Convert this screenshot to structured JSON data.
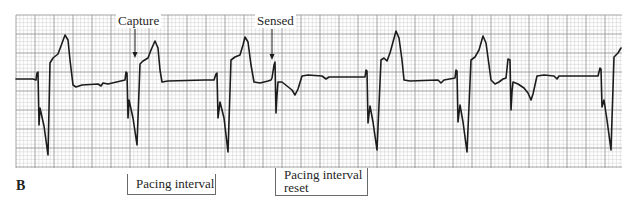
{
  "figure": {
    "panel_letter": "B",
    "colors": {
      "background": "#ffffff",
      "grid_minor": "#cfcfcf",
      "grid_major": "#8e8e8e",
      "trace": "#1c1c1c",
      "bracket": "#6a6a6a"
    },
    "grid": {
      "x0": 16,
      "y0": 15,
      "x1": 622,
      "y1": 168,
      "minor_step": 3.8,
      "major_every": 5
    },
    "annotations": [
      {
        "id": "capture",
        "label": "Capture",
        "label_x": 116,
        "label_y": 14,
        "arrow_x": 135,
        "arrow_y1": 29,
        "arrow_y2": 58
      },
      {
        "id": "sensed",
        "label": "Sensed",
        "label_x": 255,
        "label_y": 14,
        "arrow_x": 272,
        "arrow_y1": 29,
        "arrow_y2": 60
      }
    ],
    "brackets": [
      {
        "id": "pacing-interval",
        "lines": [
          "Pacing interval"
        ],
        "x": 127,
        "y": 174,
        "w": 89,
        "h": 21
      },
      {
        "id": "pacing-interval-reset",
        "lines": [
          "Pacing interval",
          "reset"
        ],
        "x": 275,
        "y": 168,
        "w": 93,
        "h": 28
      }
    ]
  },
  "chart_data": {
    "type": "line",
    "title": "",
    "panel": "B",
    "annotations": [
      "Capture",
      "Sensed"
    ],
    "interval_labels": [
      "Pacing interval",
      "Pacing interval reset"
    ],
    "paced_beats_x": [
      38,
      127,
      217,
      367,
      457,
      601
    ],
    "sensed_events_x": [
      275,
      510
    ],
    "trace_points": [
      [
        16,
        79
      ],
      [
        33,
        79
      ],
      [
        36,
        80
      ],
      [
        37,
        73
      ],
      [
        38,
        72
      ],
      [
        39,
        125
      ],
      [
        40,
        108
      ],
      [
        44,
        126
      ],
      [
        48,
        155
      ],
      [
        50,
        63
      ],
      [
        53,
        58
      ],
      [
        58,
        54
      ],
      [
        61,
        46
      ],
      [
        65,
        35
      ],
      [
        68,
        40
      ],
      [
        70,
        60
      ],
      [
        73,
        85
      ],
      [
        76,
        87
      ],
      [
        82,
        85
      ],
      [
        98,
        84
      ],
      [
        101,
        86
      ],
      [
        103,
        83
      ],
      [
        108,
        84
      ],
      [
        125,
        80
      ],
      [
        126,
        72
      ],
      [
        127,
        73
      ],
      [
        128,
        118
      ],
      [
        129,
        100
      ],
      [
        133,
        118
      ],
      [
        137,
        145
      ],
      [
        140,
        64
      ],
      [
        143,
        61
      ],
      [
        148,
        58
      ],
      [
        151,
        50
      ],
      [
        155,
        41
      ],
      [
        158,
        48
      ],
      [
        160,
        70
      ],
      [
        162,
        82
      ],
      [
        168,
        81
      ],
      [
        205,
        80
      ],
      [
        214,
        80
      ],
      [
        216,
        74
      ],
      [
        217,
        73
      ],
      [
        218,
        118
      ],
      [
        220,
        102
      ],
      [
        224,
        118
      ],
      [
        228,
        152
      ],
      [
        231,
        60
      ],
      [
        235,
        57
      ],
      [
        240,
        55
      ],
      [
        243,
        45
      ],
      [
        245,
        37
      ],
      [
        248,
        42
      ],
      [
        251,
        65
      ],
      [
        254,
        82
      ],
      [
        260,
        83
      ],
      [
        268,
        81
      ],
      [
        271,
        80
      ],
      [
        272,
        78
      ],
      [
        274,
        65
      ],
      [
        275,
        62
      ],
      [
        276,
        113
      ],
      [
        277,
        95
      ],
      [
        278,
        82
      ],
      [
        282,
        82
      ],
      [
        287,
        86
      ],
      [
        292,
        90
      ],
      [
        295,
        95
      ],
      [
        298,
        89
      ],
      [
        302,
        76
      ],
      [
        308,
        75
      ],
      [
        322,
        76
      ],
      [
        326,
        79
      ],
      [
        329,
        77
      ],
      [
        340,
        77
      ],
      [
        365,
        77
      ],
      [
        366,
        70
      ],
      [
        367,
        71
      ],
      [
        368,
        123
      ],
      [
        370,
        106
      ],
      [
        373,
        122
      ],
      [
        377,
        150
      ],
      [
        381,
        60
      ],
      [
        384,
        58
      ],
      [
        387,
        61
      ],
      [
        390,
        53
      ],
      [
        393,
        42
      ],
      [
        396,
        31
      ],
      [
        399,
        38
      ],
      [
        402,
        60
      ],
      [
        404,
        80
      ],
      [
        410,
        81
      ],
      [
        438,
        80
      ],
      [
        441,
        83
      ],
      [
        444,
        80
      ],
      [
        455,
        78
      ],
      [
        456,
        70
      ],
      [
        457,
        71
      ],
      [
        458,
        122
      ],
      [
        460,
        105
      ],
      [
        463,
        122
      ],
      [
        467,
        152
      ],
      [
        471,
        60
      ],
      [
        475,
        57
      ],
      [
        479,
        50
      ],
      [
        483,
        36
      ],
      [
        486,
        43
      ],
      [
        489,
        65
      ],
      [
        491,
        80
      ],
      [
        495,
        84
      ],
      [
        499,
        82
      ],
      [
        503,
        79
      ],
      [
        506,
        78
      ],
      [
        508,
        59
      ],
      [
        510,
        60
      ],
      [
        511,
        110
      ],
      [
        512,
        92
      ],
      [
        513,
        82
      ],
      [
        518,
        84
      ],
      [
        524,
        88
      ],
      [
        528,
        93
      ],
      [
        531,
        100
      ],
      [
        533,
        94
      ],
      [
        537,
        76
      ],
      [
        544,
        75
      ],
      [
        554,
        76
      ],
      [
        557,
        79
      ],
      [
        559,
        76
      ],
      [
        570,
        76
      ],
      [
        598,
        76
      ],
      [
        600,
        68
      ],
      [
        601,
        69
      ],
      [
        602,
        107
      ],
      [
        604,
        100
      ],
      [
        607,
        120
      ],
      [
        611,
        150
      ],
      [
        614,
        57
      ],
      [
        618,
        53
      ],
      [
        621,
        48
      ]
    ]
  }
}
